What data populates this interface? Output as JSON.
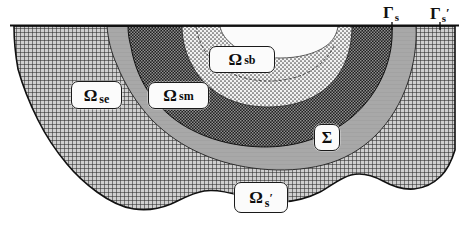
{
  "figure": {
    "kind": "domain-decomposition-diagram",
    "caption_ghost_text": "heat flux inside it, namely the void region φ, the fracture region",
    "background_color": "#ffffff",
    "ink_color": "#1a1a1a"
  },
  "boundaries": [
    {
      "id": "gamma-s",
      "symbol": "Γ",
      "subscript": "s",
      "prime": "",
      "x": 385,
      "y": 4
    },
    {
      "id": "gamma-s-prime",
      "symbol": "Γ",
      "subscript": "s",
      "prime": "′",
      "x": 432,
      "y": 4
    }
  ],
  "regions": [
    {
      "id": "omega-sb",
      "symbol": "Ω",
      "subscript": "sb",
      "prime": "",
      "fill": "fine-stipple-light",
      "fill_color": "#d8d8d8",
      "description": "innermost light stippled core region near the top surface"
    },
    {
      "id": "omega-sm",
      "symbol": "Ω",
      "subscript": "sm",
      "prime": "",
      "fill": "dark-checker",
      "fill_color": "#3a3a3a",
      "description": "dark checkerboard annulus surrounding the core"
    },
    {
      "id": "omega-se",
      "symbol": "Ω",
      "subscript": "se",
      "prime": "",
      "fill": "solid-gray",
      "fill_color": "#a9a9a9",
      "description": "mid gray band between the dark annulus and the outer hatch"
    },
    {
      "id": "sigma",
      "symbol": "Σ",
      "subscript": "",
      "prime": "",
      "fill": "solid-gray",
      "fill_color": "#a9a9a9",
      "description": "interface layer label on the lower gray band"
    },
    {
      "id": "omega-s-prime",
      "symbol": "Ω",
      "subscript": "s",
      "prime": "′",
      "fill": "cross-hatch",
      "fill_color": "#6f6f6f",
      "description": "outer cross-hatched half-space with irregular bottom boundary"
    }
  ],
  "labels": {
    "omega_sb": {
      "omega": "Ω",
      "sub": "sb"
    },
    "omega_se": {
      "omega": "Ω",
      "sub": "se"
    },
    "omega_sm": {
      "omega": "Ω",
      "sub": "sm"
    },
    "sigma": {
      "symbol": "Σ"
    },
    "omega_s_prime": {
      "omega": "Ω",
      "sub": "s",
      "prime": "′"
    },
    "gamma_s": {
      "gamma": "Γ",
      "sub": "s",
      "prime": ""
    },
    "gamma_s_prime": {
      "gamma": "Γ",
      "sub": "s",
      "prime": "′"
    }
  }
}
